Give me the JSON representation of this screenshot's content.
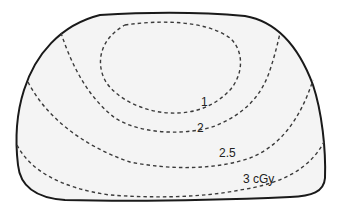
{
  "diagram": {
    "type": "isodose-contour-diagram",
    "background_color": "#ffffff",
    "region_fill_color": "#f4f4f4",
    "outline_color": "#1a1a1a",
    "contour_color": "#3a3a3a",
    "contours": [
      {
        "id": "contour-1",
        "label": "1"
      },
      {
        "id": "contour-2",
        "label": "2"
      },
      {
        "id": "contour-2-5",
        "label": "2.5"
      },
      {
        "id": "contour-3",
        "label": "3 cGy"
      }
    ]
  }
}
